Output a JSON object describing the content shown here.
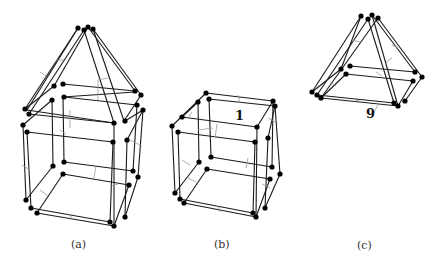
{
  "figures": [
    {
      "id": "a",
      "caption": "(a)",
      "description": "cube frame with pyramid roof (house shape)"
    },
    {
      "id": "b",
      "caption": "(b)",
      "description": "cube frame",
      "edge_label": "1"
    },
    {
      "id": "c",
      "caption": "(c)",
      "description": "square pyramid frame",
      "edge_label": "9"
    }
  ],
  "colors": {
    "edge": "#1a1a1a",
    "node": "#000000",
    "tick": "#9a9a9a",
    "background": "#ffffff"
  }
}
